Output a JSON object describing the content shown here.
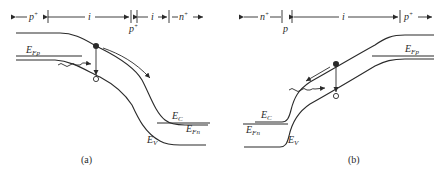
{
  "figure": {
    "panels": [
      {
        "id": "a",
        "caption": "(a)",
        "regions": [
          {
            "label": "p",
            "sup": "+"
          },
          {
            "label": "i",
            "sup": ""
          },
          {
            "label": "p",
            "sup": "+"
          },
          {
            "label": "i",
            "sup": ""
          },
          {
            "label": "n",
            "sup": "+"
          }
        ],
        "levels": {
          "fermi_p": {
            "main": "E",
            "sub": "Fp"
          },
          "conduction": {
            "main": "E",
            "sub": "C"
          },
          "fermi_n": {
            "main": "E",
            "sub": "Fn"
          },
          "valence": {
            "main": "E",
            "sub": "V"
          }
        }
      },
      {
        "id": "b",
        "caption": "(b)",
        "regions": [
          {
            "label": "n",
            "sup": "+"
          },
          {
            "label": "p",
            "sup": ""
          },
          {
            "label": "i",
            "sup": ""
          },
          {
            "label": "p",
            "sup": "+"
          }
        ],
        "levels": {
          "fermi_p": {
            "main": "E",
            "sub": "Fp"
          },
          "conduction": {
            "main": "E",
            "sub": "C"
          },
          "fermi_n": {
            "main": "E",
            "sub": "Fn"
          },
          "valence": {
            "main": "E",
            "sub": "V"
          }
        }
      }
    ],
    "colors": {
      "ink": "#2a2a2a",
      "background": "#ffffff"
    }
  }
}
